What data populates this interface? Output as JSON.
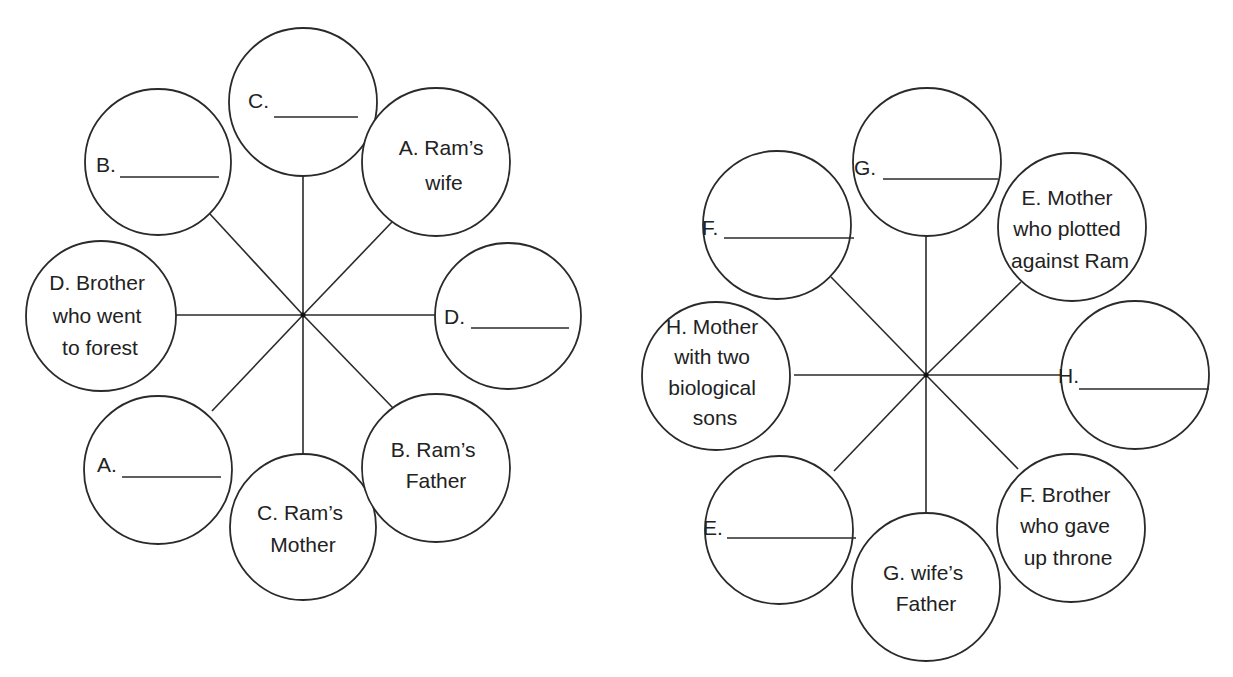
{
  "diagrams": [
    {
      "id": "left-web",
      "hub": {
        "x": 303,
        "y": 315
      },
      "nodes": [
        {
          "key": "C_blank",
          "cx": 303,
          "cy": 102,
          "r": 74,
          "type": "blank",
          "letter": "C.",
          "lines": []
        },
        {
          "key": "B_blank",
          "cx": 158,
          "cy": 162,
          "r": 73,
          "type": "blank",
          "letter": "B.",
          "lines": []
        },
        {
          "key": "A_clue",
          "cx": 436,
          "cy": 162,
          "r": 74,
          "type": "clue",
          "letter": "",
          "lines": [
            "A. Ram’s",
            "wife"
          ]
        },
        {
          "key": "D_clue",
          "cx": 101,
          "cy": 316,
          "r": 75,
          "type": "clue",
          "letter": "",
          "lines": [
            "D. Brother",
            "who went",
            "to forest"
          ]
        },
        {
          "key": "D_blank",
          "cx": 508,
          "cy": 316,
          "r": 73,
          "type": "blank",
          "letter": "D.",
          "lines": []
        },
        {
          "key": "A_blank",
          "cx": 158,
          "cy": 470,
          "r": 74,
          "type": "blank",
          "letter": "A.",
          "lines": []
        },
        {
          "key": "C_clue",
          "cx": 303,
          "cy": 527,
          "r": 73,
          "type": "clue",
          "letter": "",
          "lines": [
            "C. Ram’s",
            "Mother"
          ]
        },
        {
          "key": "B_clue",
          "cx": 436,
          "cy": 468,
          "r": 74,
          "type": "clue",
          "letter": "",
          "lines": [
            "B. Ram’s",
            "Father"
          ]
        }
      ]
    },
    {
      "id": "right-web",
      "hub": {
        "x": 926,
        "y": 375
      },
      "nodes": [
        {
          "key": "G_blank",
          "cx": 927,
          "cy": 162,
          "r": 74,
          "type": "blank",
          "letter": "G.",
          "lines": []
        },
        {
          "key": "F_blank",
          "cx": 777,
          "cy": 225,
          "r": 74,
          "type": "blank",
          "letter": "F.",
          "lines": []
        },
        {
          "key": "E_clue",
          "cx": 1072,
          "cy": 227,
          "r": 74,
          "type": "clue",
          "letter": "",
          "lines": [
            "E. Mother",
            "who plotted",
            "against Ram"
          ]
        },
        {
          "key": "H_clue",
          "cx": 716,
          "cy": 376,
          "r": 74,
          "type": "clue",
          "letter": "",
          "lines": [
            "H. Mother",
            "with two",
            "biological",
            "sons"
          ]
        },
        {
          "key": "H_blank",
          "cx": 1135,
          "cy": 375,
          "r": 74,
          "type": "blank",
          "letter": "H.",
          "lines": []
        },
        {
          "key": "E_blank",
          "cx": 779,
          "cy": 530,
          "r": 74,
          "type": "blank",
          "letter": "E.",
          "lines": []
        },
        {
          "key": "G_clue",
          "cx": 926,
          "cy": 587,
          "r": 74,
          "type": "clue",
          "letter": "",
          "lines": [
            "G. wife’s",
            "Father"
          ]
        },
        {
          "key": "F_clue",
          "cx": 1071,
          "cy": 528,
          "r": 74,
          "type": "clue",
          "letter": "",
          "lines": [
            "F. Brother",
            "who gave",
            "up throne"
          ]
        }
      ]
    }
  ],
  "labels": {
    "left": {
      "C_blank": "C.",
      "B_blank": "B.",
      "D_blank": "D.",
      "A_blank": "A.",
      "A_clue": [
        "A. Ram’s",
        "wife"
      ],
      "D_clue": [
        "D. Brother",
        "who went",
        "to forest"
      ],
      "C_clue": [
        "C. Ram’s",
        "Mother"
      ],
      "B_clue": [
        "B. Ram’s",
        "Father"
      ]
    },
    "right": {
      "G_blank": "G.",
      "F_blank": "F.",
      "H_blank": "H.",
      "E_blank": "E.",
      "E_clue": [
        "E. Mother",
        "who plotted",
        "against Ram"
      ],
      "H_clue": [
        "H. Mother",
        "with two",
        "biological",
        "sons"
      ],
      "G_clue": [
        "G. wife’s",
        "Father"
      ],
      "F_clue": [
        "F. Brother",
        "who gave",
        "up throne"
      ]
    }
  }
}
